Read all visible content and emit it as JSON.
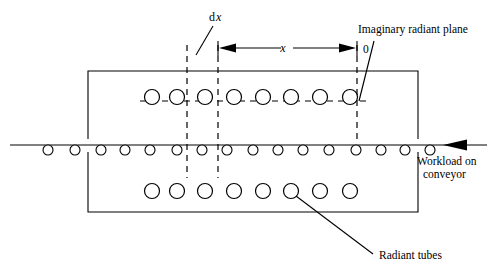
{
  "diagram": {
    "labels": {
      "dx_d": "d",
      "dx_x": "x",
      "dimension_x": "x",
      "origin": "0",
      "imaginary_plane": "Imaginary radiant plane",
      "workload_line1": "Workload on",
      "workload_line2": "conveyor",
      "radiant_tubes": "Radiant tubes"
    },
    "colors": {
      "ink": "#000000",
      "background": "#ffffff"
    },
    "geometry": {
      "furnace_box": {
        "left": 88,
        "right": 418,
        "top": 71,
        "bottom": 212
      },
      "conveyor_y": 145,
      "top_tube_row_y": 97,
      "bottom_tube_row_y": 191,
      "tube_radius": 7.5,
      "workload_radius": 5,
      "dashed_line_1_x": 187,
      "dashed_line_2_x": 218,
      "dashed_plane_x": 357,
      "dashed_top_y": 45,
      "dashed_bottom_y": 178,
      "dimension_line_y": 48
    },
    "counts": {
      "top_tubes": 8,
      "bottom_tubes": 8,
      "workload_items": 16
    },
    "top_tube_x": [
      152,
      177,
      205,
      234,
      263,
      291,
      320,
      350
    ],
    "bottom_tube_x": [
      152,
      177,
      205,
      234,
      263,
      291,
      320,
      350
    ],
    "workload_x": [
      48,
      75,
      101,
      125,
      150,
      177,
      202,
      227,
      253,
      278,
      303,
      329,
      356,
      381,
      405,
      430
    ]
  }
}
